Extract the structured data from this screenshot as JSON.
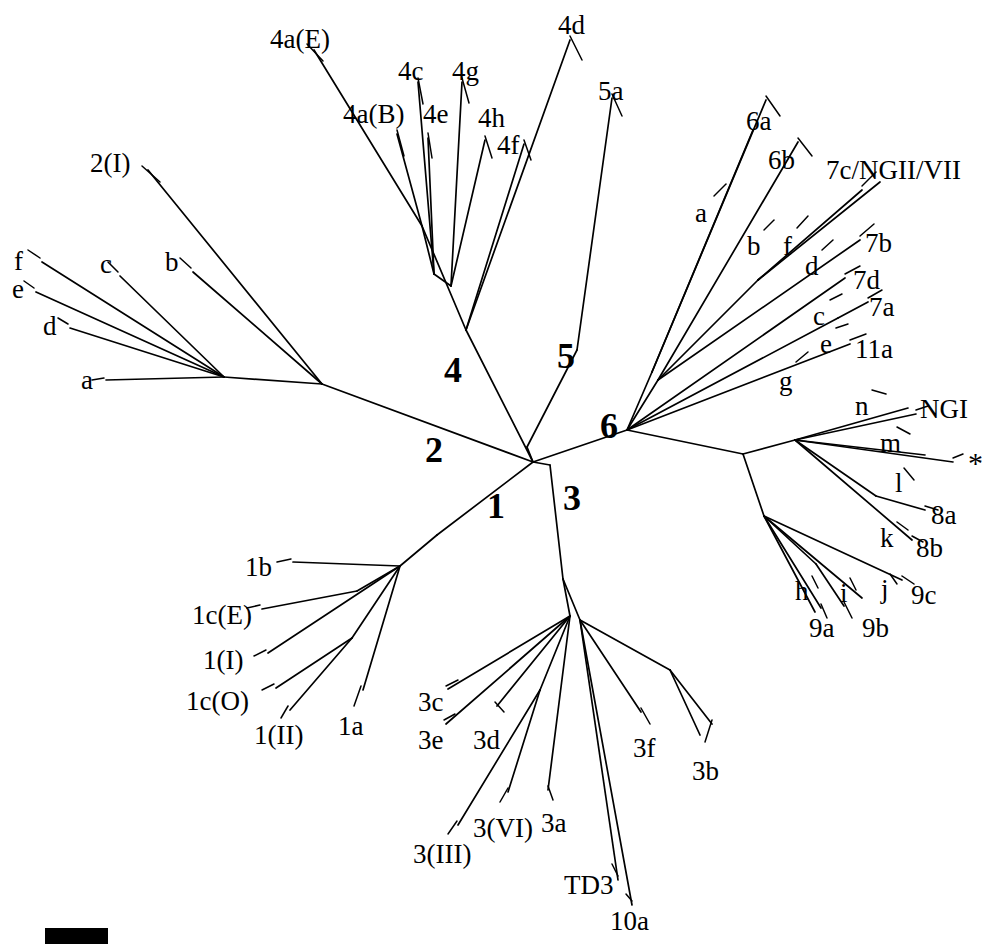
{
  "figure": {
    "kind": "unrooted-phylogenetic-tree",
    "background_color": "#ffffff",
    "line_color": "#000000",
    "width": 1001,
    "height": 944
  },
  "clade_labels": [
    {
      "name": "clade-1",
      "text": "1",
      "x": 487,
      "y": 488
    },
    {
      "name": "clade-2",
      "text": "2",
      "x": 425,
      "y": 432
    },
    {
      "name": "clade-3",
      "text": "3",
      "x": 563,
      "y": 480
    },
    {
      "name": "clade-4",
      "text": "4",
      "x": 444,
      "y": 352
    },
    {
      "name": "clade-5",
      "text": "5",
      "x": 557,
      "y": 338
    },
    {
      "name": "clade-6",
      "text": "6",
      "x": 600,
      "y": 408
    }
  ],
  "tip_labels": [
    {
      "name": "tip-4a-E",
      "text": "4a(E)",
      "x": 270,
      "y": 26
    },
    {
      "name": "tip-4d",
      "text": "4d",
      "x": 558,
      "y": 12
    },
    {
      "name": "tip-4c",
      "text": "4c",
      "x": 398,
      "y": 58
    },
    {
      "name": "tip-4g",
      "text": "4g",
      "x": 452,
      "y": 58
    },
    {
      "name": "tip-5a",
      "text": "5a",
      "x": 598,
      "y": 78
    },
    {
      "name": "tip-4a-B",
      "text": "4a(B)",
      "x": 343,
      "y": 101
    },
    {
      "name": "tip-4e",
      "text": "4e",
      "x": 423,
      "y": 101
    },
    {
      "name": "tip-4h",
      "text": "4h",
      "x": 478,
      "y": 105
    },
    {
      "name": "tip-4f",
      "text": "4f",
      "x": 497,
      "y": 132
    },
    {
      "name": "tip-6a",
      "text": "6a",
      "x": 746,
      "y": 108
    },
    {
      "name": "tip-6b",
      "text": "6b",
      "x": 768,
      "y": 147
    },
    {
      "name": "tip-7c-NGII-VII",
      "text": "7c/NGII/VII",
      "x": 826,
      "y": 157
    },
    {
      "name": "tip-2-I",
      "text": "2(I)",
      "x": 90,
      "y": 150
    },
    {
      "name": "tip-7b",
      "text": "7b",
      "x": 865,
      "y": 230
    },
    {
      "name": "tip-7d",
      "text": "7d",
      "x": 853,
      "y": 267
    },
    {
      "name": "tip-7a",
      "text": "7a",
      "x": 869,
      "y": 294
    },
    {
      "name": "tip-11a",
      "text": "11a",
      "x": 855,
      "y": 336
    },
    {
      "name": "tip-f",
      "text": "f",
      "x": 14,
      "y": 248
    },
    {
      "name": "tip-c",
      "text": "c",
      "x": 100,
      "y": 251
    },
    {
      "name": "tip-b",
      "text": "b",
      "x": 165,
      "y": 249
    },
    {
      "name": "tip-e",
      "text": "e",
      "x": 12,
      "y": 276
    },
    {
      "name": "tip-d",
      "text": "d",
      "x": 43,
      "y": 313
    },
    {
      "name": "tip-a-left",
      "text": "a",
      "x": 81,
      "y": 367
    },
    {
      "name": "tip-NGI",
      "text": "NGI",
      "x": 920,
      "y": 396
    },
    {
      "name": "tip-8a",
      "text": "8a",
      "x": 931,
      "y": 502
    },
    {
      "name": "tip-8b",
      "text": "8b",
      "x": 916,
      "y": 535
    },
    {
      "name": "tip-9c",
      "text": "9c",
      "x": 911,
      "y": 582
    },
    {
      "name": "tip-9a",
      "text": "9a",
      "x": 809,
      "y": 615
    },
    {
      "name": "tip-9b",
      "text": "9b",
      "x": 862,
      "y": 615
    },
    {
      "name": "tip-1b",
      "text": "1b",
      "x": 245,
      "y": 554
    },
    {
      "name": "tip-1c-E",
      "text": "1c(E)",
      "x": 192,
      "y": 602
    },
    {
      "name": "tip-1-I",
      "text": "1(I)",
      "x": 203,
      "y": 647
    },
    {
      "name": "tip-1c-O",
      "text": "1c(O)",
      "x": 186,
      "y": 688
    },
    {
      "name": "tip-1-II",
      "text": "1(II)",
      "x": 254,
      "y": 722
    },
    {
      "name": "tip-1a",
      "text": "1a",
      "x": 338,
      "y": 713
    },
    {
      "name": "tip-3c",
      "text": "3c",
      "x": 418,
      "y": 689
    },
    {
      "name": "tip-3e",
      "text": "3e",
      "x": 418,
      "y": 727
    },
    {
      "name": "tip-3d",
      "text": "3d",
      "x": 473,
      "y": 727
    },
    {
      "name": "tip-3f",
      "text": "3f",
      "x": 633,
      "y": 735
    },
    {
      "name": "tip-3b",
      "text": "3b",
      "x": 692,
      "y": 758
    },
    {
      "name": "tip-3-VI",
      "text": "3(VI)",
      "x": 473,
      "y": 815
    },
    {
      "name": "tip-3a",
      "text": "3a",
      "x": 541,
      "y": 810
    },
    {
      "name": "tip-3-III",
      "text": "3(III)",
      "x": 413,
      "y": 841
    },
    {
      "name": "tip-TD3",
      "text": "TD3",
      "x": 564,
      "y": 872
    },
    {
      "name": "tip-10a",
      "text": "10a",
      "x": 610,
      "y": 908
    }
  ],
  "pointer_labels": [
    {
      "name": "pointer-a-clade6",
      "text": "a",
      "x": 695,
      "y": 200
    },
    {
      "name": "pointer-b-clade6",
      "text": "b",
      "x": 747,
      "y": 233
    },
    {
      "name": "pointer-f-clade6",
      "text": "f",
      "x": 783,
      "y": 233
    },
    {
      "name": "pointer-d-clade6",
      "text": "d",
      "x": 805,
      "y": 253
    },
    {
      "name": "pointer-c-clade6",
      "text": "c",
      "x": 813,
      "y": 303
    },
    {
      "name": "pointer-e-clade6",
      "text": "e",
      "x": 820,
      "y": 331
    },
    {
      "name": "pointer-g-clade6",
      "text": "g",
      "x": 779,
      "y": 368
    },
    {
      "name": "pointer-n",
      "text": "n",
      "x": 855,
      "y": 393
    },
    {
      "name": "pointer-m",
      "text": "m",
      "x": 880,
      "y": 430
    },
    {
      "name": "pointer-l",
      "text": "l",
      "x": 895,
      "y": 470
    },
    {
      "name": "pointer-k",
      "text": "k",
      "x": 880,
      "y": 525
    },
    {
      "name": "pointer-h",
      "text": "h",
      "x": 795,
      "y": 578
    },
    {
      "name": "pointer-i",
      "text": "i",
      "x": 840,
      "y": 580
    },
    {
      "name": "pointer-j",
      "text": "j",
      "x": 881,
      "y": 576
    }
  ],
  "special_labels": [
    {
      "name": "asterisk-marker",
      "text": "*",
      "x": 968,
      "y": 448
    }
  ],
  "scale_bar": {
    "name": "scale-bar",
    "x": 45,
    "y": 928,
    "width": 63,
    "height": 16,
    "color": "#000000"
  },
  "branches": [
    {
      "name": "edge-center-to-clade2",
      "d": "M 533 462 L 322 384"
    },
    {
      "name": "edge-center-to-clade4",
      "d": "M 533 462 L 466 330"
    },
    {
      "name": "edge-center-to-clade5",
      "d": "M 527 447 L 577 350"
    },
    {
      "name": "edge-center-to-clade6",
      "d": "M 533 462 L 627 430"
    },
    {
      "name": "edge-center-to-clade1",
      "d": "M 533 462 L 437 535"
    },
    {
      "name": "edge-center-to-clade3",
      "d": "M 550 465 L 563 579"
    },
    {
      "name": "edge-center-link-a",
      "d": "M 533 462 L 527 447"
    },
    {
      "name": "edge-center-link-b",
      "d": "M 533 462 L 550 465"
    },
    {
      "name": "edge-clade2-hub",
      "d": "M 322 384 L 224 377"
    },
    {
      "name": "edge-clade2-2I",
      "d": "M 322 384 L 148 170"
    },
    {
      "name": "edge-clade2-b",
      "d": "M 322 384 L 193 272"
    },
    {
      "name": "edge-clade2-c",
      "d": "M 224 377 L 120 276"
    },
    {
      "name": "edge-clade2-f",
      "d": "M 224 377 L 42 262"
    },
    {
      "name": "edge-clade2-e",
      "d": "M 224 377 L 36 292"
    },
    {
      "name": "edge-clade2-d",
      "d": "M 224 377 L 70 328"
    },
    {
      "name": "edge-clade2-a",
      "d": "M 224 377 L 106 380"
    },
    {
      "name": "edge-clade4-node1",
      "d": "M 466 330 L 422 226"
    },
    {
      "name": "edge-clade4-4aE",
      "d": "M 422 226 L 314 50"
    },
    {
      "name": "edge-clade4-node2",
      "d": "M 422 226 L 434 274"
    },
    {
      "name": "edge-clade4-4aB",
      "d": "M 422 226 L 397 134"
    },
    {
      "name": "edge-clade4-4c",
      "d": "M 434 274 L 418 82"
    },
    {
      "name": "edge-clade4-4e",
      "d": "M 434 274 L 428 138"
    },
    {
      "name": "edge-clade4-node3",
      "d": "M 434 274 L 451 286"
    },
    {
      "name": "edge-clade4-4g",
      "d": "M 451 286 L 462 82"
    },
    {
      "name": "edge-clade4-4h",
      "d": "M 451 286 L 485 140"
    },
    {
      "name": "edge-clade4-4f",
      "d": "M 466 330 L 524 144"
    },
    {
      "name": "edge-clade5-5a",
      "d": "M 577 350 L 612 98"
    },
    {
      "name": "edge-clade4-4d",
      "d": "M 466 330 L 570 40"
    },
    {
      "name": "edge-clade6-nodeA",
      "d": "M 627 430 L 652 372"
    },
    {
      "name": "edge-clade6-a",
      "d": "M 652 372 L 753 130"
    },
    {
      "name": "edge-clade6-6a",
      "d": "M 652 372 L 766 100"
    },
    {
      "name": "edge-clade6-nodeB",
      "d": "M 627 430 L 658 380"
    },
    {
      "name": "edge-clade6-6b",
      "d": "M 658 380 L 798 142"
    },
    {
      "name": "edge-clade6-nodeC",
      "d": "M 658 380 L 758 280"
    },
    {
      "name": "edge-clade6-7c",
      "d": "M 758 280 L 862 190"
    },
    {
      "name": "edge-clade6-d",
      "d": "M 758 280 L 880 182"
    },
    {
      "name": "edge-clade6-7b",
      "d": "M 658 380 L 860 240"
    },
    {
      "name": "edge-clade6-7d",
      "d": "M 627 430 L 845 278"
    },
    {
      "name": "edge-clade6-nodeD",
      "d": "M 627 430 L 838 318"
    },
    {
      "name": "edge-clade6-7a",
      "d": "M 838 318 L 868 302"
    },
    {
      "name": "edge-clade6-11a",
      "d": "M 627 430 L 850 344"
    },
    {
      "name": "edge-clade6-right",
      "d": "M 627 430 L 743 454"
    },
    {
      "name": "edge-right-NGI-node",
      "d": "M 743 454 L 795 440"
    },
    {
      "name": "edge-right-n",
      "d": "M 795 440 L 908 408"
    },
    {
      "name": "edge-right-NGI",
      "d": "M 795 440 L 916 414"
    },
    {
      "name": "edge-right-m",
      "d": "M 795 440 L 925 455"
    },
    {
      "name": "edge-right-star",
      "d": "M 795 440 L 953 462"
    },
    {
      "name": "edge-right-l-node",
      "d": "M 795 440 L 876 496"
    },
    {
      "name": "edge-right-8a",
      "d": "M 876 496 L 925 510"
    },
    {
      "name": "edge-right-8b",
      "d": "M 795 440 L 912 540"
    },
    {
      "name": "edge-right-lower",
      "d": "M 743 454 L 764 516"
    },
    {
      "name": "edge-right-9c",
      "d": "M 764 516 L 902 580"
    },
    {
      "name": "edge-right-j",
      "d": "M 764 516 L 862 598"
    },
    {
      "name": "edge-right-i-node",
      "d": "M 764 516 L 816 564"
    },
    {
      "name": "edge-right-9b",
      "d": "M 816 564 L 844 606"
    },
    {
      "name": "edge-right-9a",
      "d": "M 764 516 L 821 608"
    },
    {
      "name": "edge-right-h",
      "d": "M 764 516 L 815 612"
    },
    {
      "name": "edge-clade1-hub",
      "d": "M 437 535 L 400 566"
    },
    {
      "name": "edge-clade1-1b",
      "d": "M 400 566 L 293 562"
    },
    {
      "name": "edge-clade1-1cE-node",
      "d": "M 400 566 L 357 591"
    },
    {
      "name": "edge-clade1-1cE",
      "d": "M 357 591 L 262 609"
    },
    {
      "name": "edge-clade1-1I",
      "d": "M 400 566 L 268 653"
    },
    {
      "name": "edge-clade1-node2",
      "d": "M 400 566 L 352 638"
    },
    {
      "name": "edge-clade1-1cO",
      "d": "M 352 638 L 276 688"
    },
    {
      "name": "edge-clade1-1II",
      "d": "M 352 638 L 290 710"
    },
    {
      "name": "edge-clade1-1a",
      "d": "M 400 566 L 363 690"
    },
    {
      "name": "edge-clade3-hub",
      "d": "M 563 579 L 570 616"
    },
    {
      "name": "edge-clade3-3c",
      "d": "M 570 616 L 448 689"
    },
    {
      "name": "edge-clade3-3e",
      "d": "M 570 616 L 446 724"
    },
    {
      "name": "edge-clade3-3d",
      "d": "M 570 616 L 497 706"
    },
    {
      "name": "edge-clade3-node2",
      "d": "M 570 616 L 540 690"
    },
    {
      "name": "edge-clade3-3III",
      "d": "M 540 690 L 458 825"
    },
    {
      "name": "edge-clade3-3VI",
      "d": "M 540 690 L 508 792"
    },
    {
      "name": "edge-clade3-3a",
      "d": "M 570 616 L 548 790"
    },
    {
      "name": "edge-clade3-node3",
      "d": "M 563 579 L 580 620"
    },
    {
      "name": "edge-clade3-TD3",
      "d": "M 580 620 L 618 880"
    },
    {
      "name": "edge-clade3-10a",
      "d": "M 580 620 L 632 905"
    },
    {
      "name": "edge-clade3-3f",
      "d": "M 580 620 L 641 712"
    },
    {
      "name": "edge-clade3-node4",
      "d": "M 580 620 L 670 670"
    },
    {
      "name": "edge-clade3-3b-1",
      "d": "M 670 670 L 700 735"
    },
    {
      "name": "edge-clade3-3b-2",
      "d": "M 670 670 L 712 724"
    }
  ],
  "leaders": [
    {
      "name": "leader-2I",
      "d": "M 142 166 L 160 182"
    },
    {
      "name": "leader-4aE",
      "d": "M 307 44 L 323 61"
    },
    {
      "name": "leader-4aB",
      "d": "M 397 130 L 404 156"
    },
    {
      "name": "leader-4c",
      "d": "M 418 78 L 423 104"
    },
    {
      "name": "leader-4e",
      "d": "M 428 133 L 432 158"
    },
    {
      "name": "leader-4g",
      "d": "M 462 78 L 469 103"
    },
    {
      "name": "leader-4h",
      "d": "M 485 136 L 492 158"
    },
    {
      "name": "leader-4f",
      "d": "M 524 140 L 531 160"
    },
    {
      "name": "leader-4d",
      "d": "M 570 36 L 582 60"
    },
    {
      "name": "leader-5a",
      "d": "M 612 94 L 622 116"
    },
    {
      "name": "leader-6a",
      "d": "M 766 96 L 780 116"
    },
    {
      "name": "leader-6b",
      "d": "M 798 138 L 812 156"
    },
    {
      "name": "leader-7c",
      "d": "M 862 186 L 876 172"
    },
    {
      "name": "leader-7b",
      "d": "M 860 236 L 874 224"
    },
    {
      "name": "leader-7d",
      "d": "M 845 274 L 860 266"
    },
    {
      "name": "leader-7a",
      "d": "M 868 298 L 882 290"
    },
    {
      "name": "leader-11a",
      "d": "M 850 340 L 866 334"
    },
    {
      "name": "leader-f-left",
      "d": "M 40 258 L 28 250"
    },
    {
      "name": "leader-e-left",
      "d": "M 34 288 L 24 281"
    },
    {
      "name": "leader-c-left",
      "d": "M 118 272 L 108 262"
    },
    {
      "name": "leader-b-left",
      "d": "M 191 268 L 180 258"
    },
    {
      "name": "leader-d-left",
      "d": "M 68 324 L 58 318"
    },
    {
      "name": "leader-a-left",
      "d": "M 104 378 L 92 380"
    },
    {
      "name": "leader-NGI",
      "d": "M 916 410 L 928 406"
    },
    {
      "name": "leader-star",
      "d": "M 953 458 L 963 454"
    },
    {
      "name": "leader-8a",
      "d": "M 925 506 L 938 510"
    },
    {
      "name": "leader-8b",
      "d": "M 912 536 L 923 542"
    },
    {
      "name": "leader-9c",
      "d": "M 902 576 L 914 584"
    },
    {
      "name": "leader-9a",
      "d": "M 821 604 L 827 618"
    },
    {
      "name": "leader-9b",
      "d": "M 844 602 L 852 618"
    },
    {
      "name": "leader-1b",
      "d": "M 291 559 L 277 562"
    },
    {
      "name": "leader-1cE",
      "d": "M 260 605 L 247 608"
    },
    {
      "name": "leader-1I",
      "d": "M 266 650 L 254 656"
    },
    {
      "name": "leader-1cO",
      "d": "M 274 684 L 262 690"
    },
    {
      "name": "leader-1II",
      "d": "M 288 706 L 281 718"
    },
    {
      "name": "leader-1a",
      "d": "M 361 686 L 354 706"
    },
    {
      "name": "leader-3c",
      "d": "M 446 686 L 458 680"
    },
    {
      "name": "leader-3e",
      "d": "M 444 720 L 455 714"
    },
    {
      "name": "leader-3d",
      "d": "M 495 702 L 504 712"
    },
    {
      "name": "leader-3f",
      "d": "M 641 708 L 650 724"
    },
    {
      "name": "leader-3b",
      "d": "M 712 720 L 705 742"
    },
    {
      "name": "leader-3VI",
      "d": "M 508 788 L 500 802"
    },
    {
      "name": "leader-3a",
      "d": "M 548 786 L 553 800"
    },
    {
      "name": "leader-3III",
      "d": "M 457 821 L 448 834"
    },
    {
      "name": "leader-TD3",
      "d": "M 618 876 L 612 864"
    },
    {
      "name": "leader-10a",
      "d": "M 632 901 L 626 894"
    },
    {
      "name": "leader-a6",
      "d": "M 714 196 L 726 184"
    },
    {
      "name": "leader-b6",
      "d": "M 764 230 L 774 220"
    },
    {
      "name": "leader-f6",
      "d": "M 797 228 L 808 216"
    },
    {
      "name": "leader-d6",
      "d": "M 822 250 L 833 240"
    },
    {
      "name": "leader-c6",
      "d": "M 830 300 L 842 294"
    },
    {
      "name": "leader-e6",
      "d": "M 836 328 L 848 324"
    },
    {
      "name": "leader-g6",
      "d": "M 796 362 L 808 352"
    },
    {
      "name": "leader-n",
      "d": "M 872 390 L 886 394"
    },
    {
      "name": "leader-m",
      "d": "M 897 427 L 910 434"
    },
    {
      "name": "leader-l",
      "d": "M 904 468 L 914 480"
    },
    {
      "name": "leader-k",
      "d": "M 897 522 L 908 530"
    },
    {
      "name": "leader-h",
      "d": "M 812 576 L 818 588"
    },
    {
      "name": "leader-i",
      "d": "M 850 578 L 856 590"
    },
    {
      "name": "leader-j",
      "d": "M 890 574 L 897 584"
    }
  ]
}
